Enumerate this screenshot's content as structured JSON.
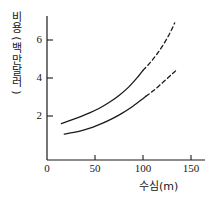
{
  "chart_data": {
    "type": "line",
    "title": "",
    "xlabel": "수심(m)",
    "ylabel": "비용(백만달러)",
    "ylabel_chars": [
      "비",
      "용",
      "(",
      "백",
      "만",
      "달",
      "러",
      ")"
    ],
    "xlim": [
      0,
      155
    ],
    "ylim": [
      0,
      7.3
    ],
    "xticks": [
      0,
      50,
      100,
      150
    ],
    "yticks": [
      2,
      4,
      6
    ],
    "xtick_labels": [
      "0",
      "50",
      "100",
      "150"
    ],
    "ytick_labels": [
      "2",
      "4",
      "6"
    ],
    "grid": false,
    "legend": "none",
    "line_color": "#1a1a1a",
    "series": [
      {
        "name": "upper-curve",
        "solid_x": [
          15,
          25,
          35,
          45,
          55,
          65,
          75,
          85,
          95,
          100
        ],
        "solid_y": [
          1.6,
          1.78,
          1.97,
          2.18,
          2.42,
          2.72,
          3.08,
          3.52,
          4.08,
          4.4
        ],
        "dashed_x": [
          100,
          107,
          114,
          121,
          128,
          133
        ],
        "dashed_y": [
          4.4,
          4.78,
          5.22,
          5.74,
          6.36,
          6.9
        ]
      },
      {
        "name": "lower-curve",
        "solid_x": [
          18,
          28,
          38,
          48,
          58,
          68,
          78,
          88,
          98,
          103
        ],
        "solid_y": [
          1.05,
          1.14,
          1.26,
          1.42,
          1.62,
          1.86,
          2.14,
          2.46,
          2.84,
          3.04
        ],
        "dashed_x": [
          103,
          110,
          117,
          124,
          130,
          134
        ],
        "dashed_y": [
          3.04,
          3.3,
          3.6,
          3.92,
          4.2,
          4.38
        ]
      }
    ]
  },
  "axes": {
    "origin_label": "0"
  }
}
